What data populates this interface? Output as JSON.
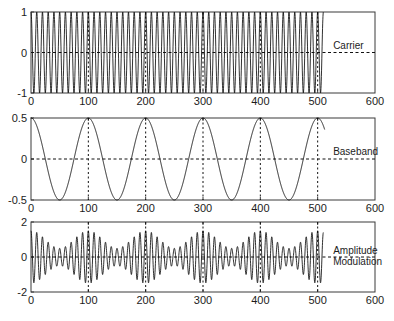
{
  "figure": {
    "width": 394,
    "height": 321,
    "background": "#ffffff",
    "axis_color": "#3a3a3a",
    "line_color": "#0d0d0d"
  },
  "chart_data": [
    {
      "type": "line",
      "name": "carrier",
      "title": "",
      "annotation": "Carrier",
      "xlabel": "",
      "ylabel": "",
      "xlim": [
        0,
        600
      ],
      "ylim": [
        -1,
        1
      ],
      "xticks": [
        0,
        100,
        200,
        300,
        400,
        500,
        600
      ],
      "xticklabels": [
        "0",
        "100",
        "200",
        "300",
        "400",
        "500",
        "600"
      ],
      "yticks": [
        -1,
        0,
        1
      ],
      "yticklabels": [
        "-1",
        "0",
        "1"
      ],
      "grid": false,
      "zero_line": true,
      "vgrid_at": [
        100,
        200,
        300,
        400,
        500
      ],
      "signal": {
        "form": "cos",
        "amplitude": 1,
        "offset": 0,
        "period": 10,
        "phase_deg": 0,
        "x_start": 0,
        "x_end": 510
      },
      "legend_position": "right-inside"
    },
    {
      "type": "line",
      "name": "baseband",
      "title": "",
      "annotation": "Baseband",
      "xlabel": "",
      "ylabel": "",
      "xlim": [
        0,
        600
      ],
      "ylim": [
        -0.5,
        0.5
      ],
      "xticks": [
        0,
        100,
        200,
        300,
        400,
        500,
        600
      ],
      "xticklabels": [
        "0",
        "100",
        "200",
        "300",
        "400",
        "500",
        "600"
      ],
      "yticks": [
        -0.5,
        0,
        0.5
      ],
      "yticklabels": [
        "-0.5",
        "0",
        "0.5"
      ],
      "grid": false,
      "zero_line": true,
      "vgrid_at": [
        100,
        200,
        300,
        400,
        500
      ],
      "signal": {
        "form": "cos",
        "amplitude": 0.5,
        "offset": 0,
        "period": 100,
        "phase_deg": 0,
        "x_start": 0,
        "x_end": 512
      },
      "legend_position": "right-inside"
    },
    {
      "type": "line",
      "name": "amplitude-modulation",
      "title": "",
      "annotation": "Amplitude Modulation",
      "annotation_lines": [
        "Amplitude",
        "Modulation"
      ],
      "xlabel": "",
      "ylabel": "",
      "xlim": [
        0,
        600
      ],
      "ylim": [
        -2,
        2
      ],
      "xticks": [
        0,
        100,
        200,
        300,
        400,
        500,
        600
      ],
      "xticklabels": [
        "0",
        "100",
        "200",
        "300",
        "400",
        "500",
        "600"
      ],
      "yticks": [
        -2,
        0,
        2
      ],
      "yticklabels": [
        "-2",
        "0",
        "2"
      ],
      "grid": false,
      "zero_line": true,
      "vgrid_at": [
        100,
        200,
        300,
        400,
        500
      ],
      "signal": {
        "form": "am",
        "carrier_amplitude": 1,
        "carrier_period": 10,
        "baseband_amplitude": 0.5,
        "baseband_period": 100,
        "dc_offset": 1,
        "envelope_max": 1.5,
        "envelope_min": 0.5,
        "x_start": 0,
        "x_end": 510
      },
      "legend_position": "right-inside"
    }
  ],
  "panels": [
    {
      "label": "Carrier"
    },
    {
      "label": "Baseband"
    },
    {
      "label": "Amplitude Modulation"
    }
  ]
}
